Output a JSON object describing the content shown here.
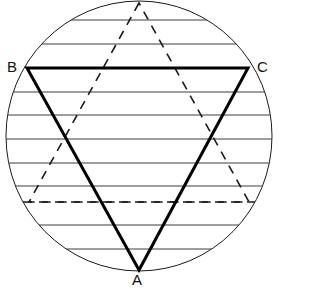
{
  "figure": {
    "background_color": "#ffffff",
    "canvas": {
      "width": 319,
      "height": 290
    }
  },
  "circle": {
    "name": "outer-circle",
    "center_x": 139,
    "center_y": 136,
    "radius_x": 133,
    "radius_y": 135,
    "stroke_color": "#1a1a1a",
    "stroke_width": 1,
    "fill": "none"
  },
  "horizontal_lines": {
    "name": "horizontal-chords",
    "stroke_color": "#3c3c3c",
    "stroke_width": 1,
    "style": "solid",
    "y_values": [
      20,
      44,
      92,
      115,
      139,
      163,
      186,
      225,
      249
    ]
  },
  "dashed_horizontal_line": {
    "name": "dashed-chord",
    "y": 202,
    "stroke_color": "#1a1a1a",
    "stroke_width": 1.6,
    "style": "dashed",
    "dash_pattern": "9 7"
  },
  "solid_triangle": {
    "name": "triangle-ABC",
    "stroke_color": "#000000",
    "stroke_width": 3,
    "style": "solid",
    "fill": "none",
    "vertices": [
      {
        "label": "A",
        "x": 139,
        "y": 270
      },
      {
        "label": "B",
        "x": 27,
        "y": 68
      },
      {
        "label": "C",
        "x": 248,
        "y": 68
      }
    ]
  },
  "dashed_triangle": {
    "name": "dashed-inverted-triangle",
    "stroke_color": "#1a1a1a",
    "stroke_width": 1.6,
    "style": "dashed",
    "dash_pattern": "9 7",
    "fill": "none",
    "vertices": [
      {
        "label": "apex",
        "x": 139,
        "y": 3
      },
      {
        "label": "left",
        "x": 29,
        "y": 202
      },
      {
        "label": "right",
        "x": 249,
        "y": 202
      }
    ]
  },
  "labels": {
    "A": "A",
    "B": "B",
    "C": "C"
  }
}
